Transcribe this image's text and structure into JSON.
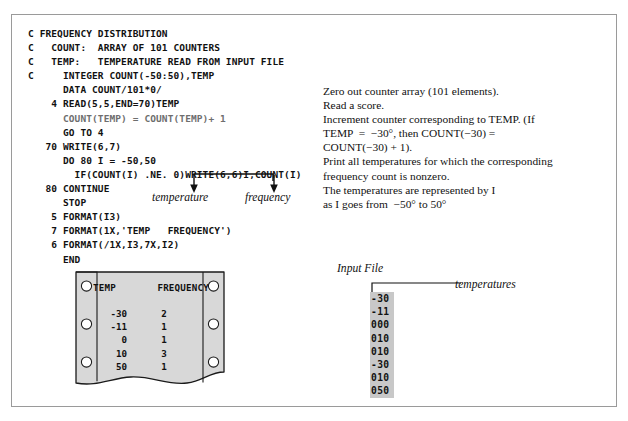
{
  "figure": {
    "border_color": "#9a9a9a",
    "background": "#ffffff"
  },
  "code": {
    "language": "FORTRAN",
    "lines": [
      {
        "text": "C FREQUENCY DISTRIBUTION",
        "faded": false
      },
      {
        "text": "C   COUNT:  ARRAY OF 101 COUNTERS",
        "faded": false
      },
      {
        "text": "C   TEMP:   TEMPERATURE READ FROM INPUT FILE",
        "faded": false
      },
      {
        "text": "C     INTEGER COUNT(-50:50),TEMP",
        "faded": false
      },
      {
        "text": "      DATA COUNT/101*0/",
        "faded": false
      },
      {
        "text": "    4 READ(5,5,END=70)TEMP",
        "faded": false
      },
      {
        "text": "      COUNT(TEMP) = COUNT(TEMP)+ 1",
        "faded": true
      },
      {
        "text": "      GO TO 4",
        "faded": false
      },
      {
        "text": "   70 WRITE(6,7)",
        "faded": false
      },
      {
        "text": "      DO 80 I = -50,50",
        "faded": false
      },
      {
        "text": "        IF(COUNT(I) .NE. 0)WRITE(6,6)I,COUNT(I)",
        "faded": false
      },
      {
        "text": "   80 CONTINUE",
        "faded": false
      },
      {
        "text": "      STOP",
        "faded": false
      },
      {
        "text": "    5 FORMAT(I3)",
        "faded": false
      },
      {
        "text": "    7 FORMAT(1X,'TEMP   FREQUENCY')",
        "faded": false
      },
      {
        "text": "    6 FORMAT(/1X,I3,7X,I2)",
        "faded": false
      },
      {
        "text": "      END",
        "faded": false
      }
    ]
  },
  "commentary": {
    "lines": [
      "Zero out counter array (101 elements).",
      "Read a score.",
      "Increment counter corresponding to TEMP. (If",
      "TEMP  =  −30°, then COUNT(−30) =",
      "COUNT(−30) + 1).",
      "Print all temperatures for which the corresponding",
      "frequency count is nonzero.",
      "The temperatures are represented by I",
      "as I goes from  −50° to 50°"
    ]
  },
  "callouts": {
    "temperature_label": "temperature",
    "frequency_label": "frequency"
  },
  "printout": {
    "headers": {
      "temp": "TEMP",
      "frequency": "FREQUENCY"
    },
    "rows": [
      {
        "temp": "-30",
        "frequency": "2"
      },
      {
        "temp": "-11",
        "frequency": "1"
      },
      {
        "temp": "0",
        "frequency": "1"
      },
      {
        "temp": "10",
        "frequency": "3"
      },
      {
        "temp": "50",
        "frequency": "1"
      }
    ]
  },
  "input_file": {
    "title": "Input File",
    "annotation": "temperatures",
    "values": [
      "-30",
      "-11",
      "000",
      "010",
      "010",
      "-30",
      "010",
      "050"
    ]
  }
}
